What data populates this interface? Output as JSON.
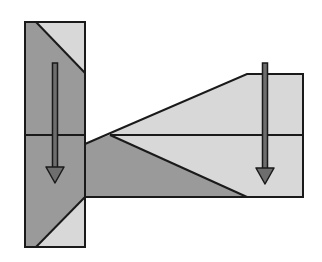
{
  "diagram": {
    "colors": {
      "background": "#ffffff",
      "dark_fill": "#9a9a9a",
      "light_fill": "#d8d8d8",
      "stroke": "#1a1a1a",
      "arrow_fill": "#6e6e6e"
    },
    "left_block": {
      "x": 25,
      "y": 22,
      "width": 60,
      "height": 225,
      "mid_line_y": 135,
      "top_light_triangle": [
        [
          36,
          22
        ],
        [
          85,
          22
        ],
        [
          85,
          73
        ]
      ],
      "bottom_light_triangle": [
        [
          36,
          247
        ],
        [
          85,
          197
        ],
        [
          85,
          247
        ]
      ]
    },
    "right_block": {
      "outline": [
        [
          85,
          144
        ],
        [
          247,
          74
        ],
        [
          303,
          74
        ],
        [
          303,
          197
        ],
        [
          85,
          197
        ]
      ],
      "mid_line_y": 135,
      "fan_vertex": [
        110,
        135
      ],
      "dark_triangle": [
        [
          85,
          144
        ],
        [
          110,
          135
        ],
        [
          247,
          197
        ],
        [
          85,
          197
        ]
      ]
    },
    "arrows": [
      {
        "name": "left-arrow",
        "x": 55,
        "y_start": 63,
        "y_tip": 183,
        "direction": "down"
      },
      {
        "name": "right-arrow",
        "x": 265,
        "y_start": 63,
        "y_tip": 184,
        "direction": "down"
      }
    ]
  }
}
